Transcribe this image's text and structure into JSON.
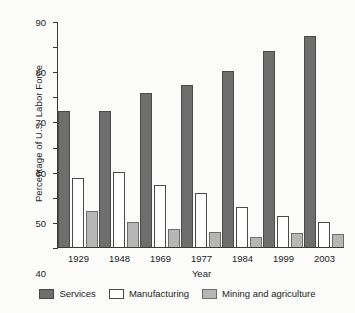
{
  "chart_data": {
    "type": "bar",
    "title": "",
    "xlabel": "Year",
    "ylabel": "Percentage of U.S. Labor Force",
    "categories": [
      "1929",
      "1948",
      "1969",
      "1977",
      "1984",
      "1999",
      "2003"
    ],
    "series": [
      {
        "name": "Services",
        "color": "#6e6e6e",
        "values": [
          54,
          54,
          61.5,
          64.5,
          70,
          78,
          84
        ]
      },
      {
        "name": "Manufacturing",
        "color": "#ffffff",
        "values": [
          27.5,
          30,
          24.5,
          21.5,
          16,
          12.5,
          10
        ]
      },
      {
        "name": "Mining and agriculture",
        "color": "#b6b6b6",
        "values": [
          14.5,
          10,
          7,
          6,
          4,
          5.5,
          5
        ]
      }
    ],
    "ylim": [
      0,
      90
    ],
    "yticks": [
      0,
      10,
      20,
      30,
      40,
      50,
      60,
      70,
      80,
      90
    ],
    "ytick_labels": [
      "0",
      "10",
      "20",
      "30",
      "40",
      "50",
      "60",
      "70",
      "80",
      "90"
    ],
    "grid": false,
    "legend_position": "bottom"
  }
}
